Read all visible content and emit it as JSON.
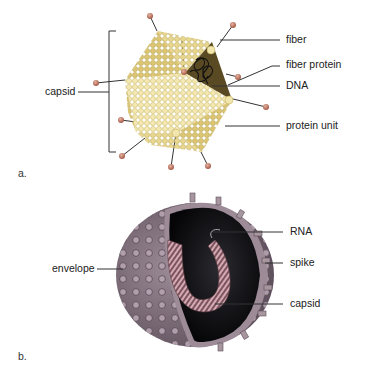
{
  "figure": {
    "panel_a": {
      "letter": "a.",
      "subject": "icosahedral virus (adenovirus-like)",
      "labels": {
        "capsid": "capsid",
        "fiber": "fiber",
        "fiber_protein": "fiber protein",
        "dna": "DNA",
        "protein_unit": "protein unit"
      },
      "colors": {
        "capsid_light": "#e9dc9a",
        "capsid_mid": "#d9c46a",
        "capsid_dark": "#c9b04e",
        "fiber_knob": "#c8806a",
        "dna_interior": "#5a4e2a"
      }
    },
    "panel_b": {
      "letter": "b.",
      "subject": "enveloped RNA virus (cutaway)",
      "labels": {
        "rna": "RNA",
        "spike": "spike",
        "capsid": "capsid",
        "envelope": "envelope"
      },
      "colors": {
        "envelope": "#8a7a86",
        "spike": "#a3909e",
        "interior": "#0d0d10",
        "capsid_helix": "#b98a94"
      }
    }
  }
}
